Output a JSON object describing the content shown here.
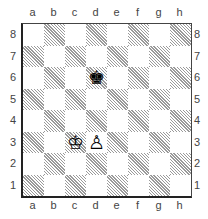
{
  "diagram": {
    "files": [
      "a",
      "b",
      "c",
      "d",
      "e",
      "f",
      "g",
      "h"
    ],
    "ranks": [
      "8",
      "7",
      "6",
      "5",
      "4",
      "3",
      "2",
      "1"
    ],
    "light_square_color": "#ffffff",
    "dark_square_style": "hatched-gray",
    "pieces": [
      {
        "square": "d6",
        "type": "king",
        "color": "black",
        "glyph": "♚"
      },
      {
        "square": "c3",
        "type": "king",
        "color": "white",
        "glyph": "♔"
      },
      {
        "square": "d3",
        "type": "pawn",
        "color": "white",
        "glyph": "♙"
      }
    ]
  }
}
